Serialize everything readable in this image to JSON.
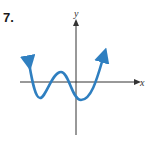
{
  "problem": {
    "number": "7."
  },
  "axes": {
    "x_label": "x",
    "y_label": "y"
  },
  "colors": {
    "curve": "#2f7fc0",
    "axis": "#333333"
  },
  "curve": {
    "description": "Quartic-like polynomial graph with both ends rising, two local minima below the x-axis and one local maximum above it",
    "points_px": [
      [
        28,
        60
      ],
      [
        40,
        98
      ],
      [
        62,
        72
      ],
      [
        82,
        100
      ],
      [
        105,
        52
      ]
    ]
  }
}
